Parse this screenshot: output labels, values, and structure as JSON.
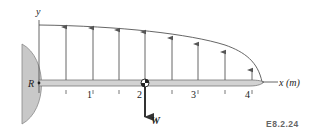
{
  "figure": {
    "label": "E8.2.24",
    "colors": {
      "line": "#555555",
      "support_fill": "#c8c8c8",
      "beam_fill": "#d2d2d2",
      "text": "#222222",
      "ref_text": "#666666"
    }
  },
  "axes": {
    "y_label": "y",
    "x_label": "x (m)",
    "ticks": [
      {
        "value": 0.5,
        "label": ""
      },
      {
        "value": 1,
        "label": "1"
      },
      {
        "value": 1.5,
        "label": ""
      },
      {
        "value": 2,
        "label": "2"
      },
      {
        "value": 2.5,
        "label": ""
      },
      {
        "value": 3,
        "label": "3"
      },
      {
        "value": 3.5,
        "label": ""
      },
      {
        "value": 4,
        "label": "4"
      }
    ]
  },
  "support": {
    "label": "R"
  },
  "load": {
    "weight_label": "W",
    "arrow_positions_m": [
      0.5,
      1.0,
      1.5,
      2.0,
      2.5,
      3.0,
      3.5,
      4.0
    ]
  }
}
